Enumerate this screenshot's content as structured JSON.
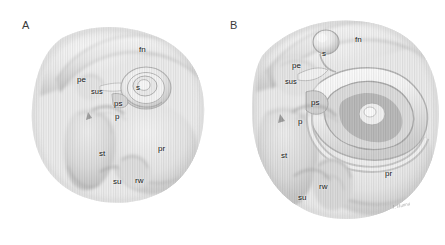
{
  "figure": {
    "kind": "anatomical-illustration",
    "background_color": "#ffffff",
    "ink_color": "#3f3f3f",
    "panel_letter_color": "#3a3a3a",
    "label_color": "#151515"
  },
  "panels": [
    {
      "id": "A",
      "letter": "A",
      "labels": [
        {
          "key": "fn",
          "text": "fn",
          "x": 139,
          "y": 46
        },
        {
          "key": "pe",
          "text": "pe",
          "x": 77,
          "y": 76
        },
        {
          "key": "sus",
          "text": "sus",
          "x": 91,
          "y": 88
        },
        {
          "key": "s",
          "text": "s",
          "x": 136,
          "y": 84
        },
        {
          "key": "ps",
          "text": "ps",
          "x": 114,
          "y": 100
        },
        {
          "key": "p",
          "text": "p",
          "x": 115,
          "y": 113
        },
        {
          "key": "st",
          "text": "st",
          "x": 99,
          "y": 150
        },
        {
          "key": "pr",
          "text": "pr",
          "x": 158,
          "y": 145
        },
        {
          "key": "su",
          "text": "su",
          "x": 113,
          "y": 178
        },
        {
          "key": "rw",
          "text": "rw",
          "x": 135,
          "y": 177
        }
      ]
    },
    {
      "id": "B",
      "letter": "B",
      "labels": [
        {
          "key": "fn",
          "text": "fn",
          "x": 355,
          "y": 36
        },
        {
          "key": "s",
          "text": "s",
          "x": 322,
          "y": 50
        },
        {
          "key": "pe",
          "text": "pe",
          "x": 292,
          "y": 62
        },
        {
          "key": "sus",
          "text": "sus",
          "x": 285,
          "y": 78
        },
        {
          "key": "ps",
          "text": "ps",
          "x": 311,
          "y": 99
        },
        {
          "key": "p",
          "text": "p",
          "x": 298,
          "y": 118
        },
        {
          "key": "st",
          "text": "st",
          "x": 281,
          "y": 152
        },
        {
          "key": "pr",
          "text": "pr",
          "x": 385,
          "y": 170
        },
        {
          "key": "rw",
          "text": "rw",
          "x": 319,
          "y": 183
        },
        {
          "key": "su",
          "text": "su",
          "x": 298,
          "y": 194
        }
      ],
      "signature": {
        "text": "J. Hanna",
        "x": 392,
        "y": 203
      }
    }
  ],
  "legend_keys": {
    "fn": "facial nerve",
    "s": "stapes",
    "pe": "pyramidal eminence",
    "sus": "subiculum / stapedius",
    "ps": "posterior sinus",
    "p": "ponticulus",
    "st": "sinus tympani",
    "pr": "promontory",
    "rw": "round window",
    "su": "subiculum"
  }
}
